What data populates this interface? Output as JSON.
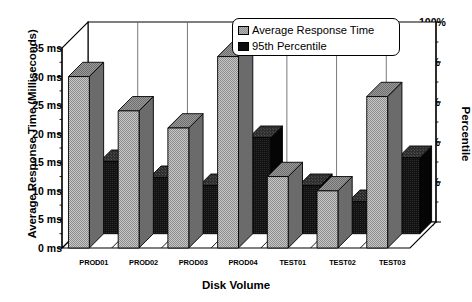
{
  "chart_data": {
    "type": "bar",
    "title": "",
    "subtitle": "",
    "xlabel": "Disk Volume",
    "ylabel": "Average Response Time (Milliseconds)",
    "y2label": "Percentile",
    "categories": [
      "PROD01",
      "PROD02",
      "PROD03",
      "PROD04",
      "TEST01",
      "TEST02",
      "TEST03"
    ],
    "series": [
      {
        "name": "Average Response Time",
        "axis": "left",
        "unit": "ms",
        "color": "#b4b4b4",
        "values": [
          30,
          24,
          21,
          33.5,
          12.5,
          10,
          26.5
        ]
      },
      {
        "name": "95th Percentile",
        "axis": "right",
        "unit": "%",
        "color": "#0d0d0d",
        "values": [
          36,
          28,
          24,
          48,
          24,
          16,
          38
        ]
      }
    ],
    "ylim": [
      0,
      35
    ],
    "yticks": [
      0,
      5,
      10,
      15,
      20,
      25,
      30,
      35
    ],
    "ytick_labels": [
      "0 ms",
      "5 ms",
      "10 ms",
      "15 ms",
      "20 ms",
      "25 ms",
      "30 ms",
      "35 ms"
    ],
    "y2lim": [
      0,
      100
    ],
    "y2ticks": [
      0,
      20,
      40,
      60,
      80,
      100
    ],
    "y2tick_labels": [
      "0%",
      "20%",
      "40%",
      "60%",
      "80%",
      "100%"
    ],
    "y2_minor_tick_step": 10,
    "grid": "vertical-only",
    "legend_position": "top-right",
    "style": "3d-bar",
    "legend": [
      {
        "label": "Average Response Time",
        "swatch": "gray"
      },
      {
        "label": "95th Percentile",
        "swatch": "black"
      }
    ]
  }
}
